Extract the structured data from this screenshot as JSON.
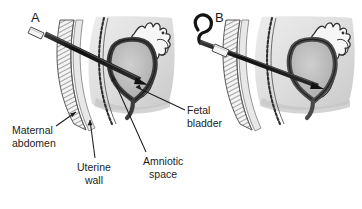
{
  "figure": {
    "background_color": "#ffffff",
    "width": 362,
    "height": 209
  },
  "panels": [
    {
      "id": "A",
      "letter": "A",
      "description": "Trocar/cannula advanced through maternal abdomen and uterine wall into the fetal bladder"
    },
    {
      "id": "B",
      "letter": "B",
      "description": "Pigtail shunt catheter with curved proximal end positioned with tip in the fetal bladder"
    }
  ],
  "annotations": [
    {
      "name": "maternal-abdomen",
      "line1": "Maternal",
      "line2": "abdomen"
    },
    {
      "name": "uterine-wall",
      "line1": "Uterine",
      "line2": "wall"
    },
    {
      "name": "amniotic-space",
      "line1": "Amniotic",
      "line2": "space"
    },
    {
      "name": "fetal-bladder",
      "line1": "Fetal",
      "line2": "bladder"
    }
  ],
  "colors": {
    "ink": "#1d1d1d",
    "outline": "#2b2b2b",
    "instrument_dark": "#1b1b1b",
    "instrument_hub": "#f2f2f2",
    "bladder_wall": "#4a4a4a",
    "bladder_lumen": "#b9b9b9",
    "amnion_fill": "#d9d9d9",
    "abdomen_fill": "#efefef",
    "shadow": "#cfcfcf",
    "background": "#ffffff"
  }
}
